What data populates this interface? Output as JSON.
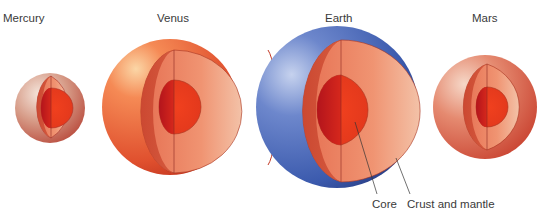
{
  "figure": {
    "planets": [
      {
        "name": "Mercury",
        "label_x": 36,
        "label_y": 12
      },
      {
        "name": "Venus",
        "label_x": 157,
        "label_y": 12
      },
      {
        "name": "Earth",
        "label_x": 325,
        "label_y": 12
      },
      {
        "name": "Mars",
        "label_x": 472,
        "label_y": 12
      }
    ],
    "annotations": {
      "core": "Core",
      "crust_and_mantle": "Crust and mantle"
    },
    "colors": {
      "mantle_light": "#f0a080",
      "mantle_dark": "#c9442e",
      "core": "#e8301c",
      "core_dark": "#b8141a",
      "venus_surface": "#ef6a3c",
      "earth_surface": "#3f63b5",
      "mars_surface": "#d8604a",
      "mercury_surface": "#d9a08c",
      "label_text": "#3a3a3a"
    }
  }
}
